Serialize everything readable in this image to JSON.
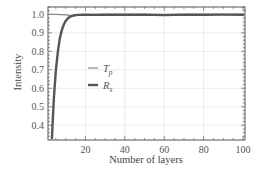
{
  "chart_data": {
    "type": "line",
    "title": "",
    "xlabel": "Number of layers",
    "ylabel": "Intensity",
    "xlim": [
      1,
      101
    ],
    "ylim": [
      0.32,
      1.04
    ],
    "x_ticks": [
      20,
      40,
      60,
      80,
      100
    ],
    "x_tick_labels": [
      "20",
      "40",
      "60",
      "80",
      "100"
    ],
    "y_ticks": [
      0.4,
      0.5,
      0.6,
      0.7,
      0.8,
      0.9,
      1.0
    ],
    "y_tick_labels": [
      "0.4",
      "0.5",
      "0.6",
      "0.7",
      "0.8",
      "0.9",
      "1.0"
    ],
    "grid": true,
    "legend_position": "center-left (inside plot)",
    "series": [
      {
        "name": "T_p",
        "label_main": "T",
        "label_sub": "p",
        "color": "#8a8a8a",
        "line_width": 1.2,
        "x": [
          1,
          5,
          10,
          13,
          15,
          20,
          30,
          40,
          50,
          60,
          70,
          80,
          90,
          100
        ],
        "values": [
          1.0,
          1.0,
          0.998,
          0.993,
          0.995,
          0.999,
          1.0,
          1.0,
          1.0,
          1.0,
          1.0,
          1.0,
          1.0,
          1.0
        ]
      },
      {
        "name": "R_s",
        "label_main": "R",
        "label_sub": "s",
        "color": "#555555",
        "line_width": 2.4,
        "x": [
          3,
          4,
          5,
          6,
          7,
          8,
          9,
          10,
          11,
          12,
          13,
          14,
          16,
          18,
          20,
          25,
          30,
          40,
          50,
          60,
          70,
          80,
          90,
          100
        ],
        "values": [
          0.33,
          0.55,
          0.7,
          0.8,
          0.87,
          0.915,
          0.945,
          0.965,
          0.978,
          0.986,
          0.991,
          0.994,
          0.997,
          0.998,
          0.999,
          0.997,
          0.999,
          0.998,
          0.999,
          0.996,
          0.999,
          0.998,
          0.999,
          0.998
        ]
      }
    ]
  }
}
